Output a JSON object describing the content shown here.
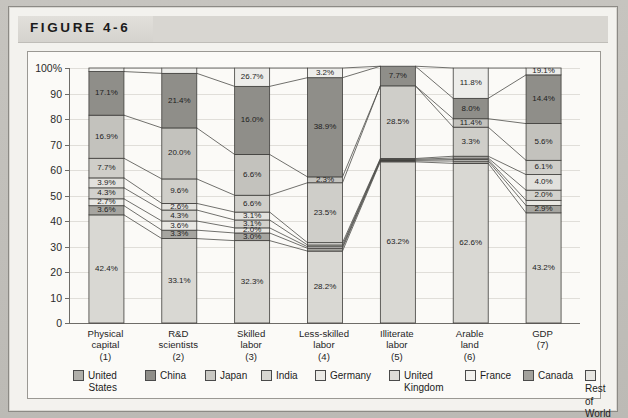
{
  "figure": {
    "title": "FIGURE 4-6"
  },
  "chart_data": {
    "type": "bar",
    "stacked": true,
    "stack_mode": "percent",
    "title": "FIGURE 4-6",
    "xlabel": "",
    "ylabel": "",
    "ylim": [
      0,
      100
    ],
    "yticks": [
      0,
      10,
      20,
      30,
      40,
      50,
      60,
      70,
      80,
      90,
      100
    ],
    "ytick_labels": [
      "0",
      "10",
      "20",
      "30",
      "40",
      "50",
      "60",
      "70",
      "80",
      "90",
      "100%"
    ],
    "grid": true,
    "legend_position": "bottom",
    "connector_lines": true,
    "categories": [
      "Physical capital",
      "R&D scientists",
      "Skilled labor",
      "Less-skilled labor",
      "Illiterate labor",
      "Arable land",
      "GDP"
    ],
    "category_numbers": [
      "(1)",
      "(2)",
      "(3)",
      "(4)",
      "(5)",
      "(6)",
      "(7)"
    ],
    "category_lines": [
      [
        "Physical",
        "capital",
        "(1)"
      ],
      [
        "R&D",
        "scientists",
        "(2)"
      ],
      [
        "Skilled",
        "labor",
        "(3)"
      ],
      [
        "Less-skilled",
        "labor",
        "(4)"
      ],
      [
        "Illiterate",
        "labor",
        "(5)"
      ],
      [
        "Arable",
        "land",
        "(6)"
      ],
      [
        "GDP",
        "(7)"
      ]
    ],
    "series": [
      {
        "name": "United States",
        "color": "#d9d8d3",
        "values": [
          42.4,
          33.1,
          32.3,
          28.2,
          63.2,
          62.6,
          43.2
        ]
      },
      {
        "name": "Canada",
        "color": "#a6a5a0",
        "values": [
          3.6,
          3.3,
          3.0,
          1.1,
          0.4,
          0.9,
          2.9
        ]
      },
      {
        "name": "France",
        "color": "#e8e7e3",
        "values": [
          2.7,
          3.6,
          2.0,
          0.6,
          0.3,
          0.6,
          2.0
        ]
      },
      {
        "name": "United Kingdom",
        "color": "#d2d1cc",
        "values": [
          4.3,
          4.3,
          3.1,
          0.7,
          0.3,
          0.6,
          4.0
        ]
      },
      {
        "name": "Germany",
        "color": "#e2e1dd",
        "values": [
          3.9,
          2.6,
          3.1,
          0.9,
          0.3,
          0.7,
          6.1
        ]
      },
      {
        "name": "India",
        "color": "#cfcec9",
        "values": [
          7.7,
          9.6,
          6.6,
          23.5,
          28.5,
          11.4,
          5.6
        ]
      },
      {
        "name": "Japan",
        "color": "#c3c2bd",
        "values": [
          16.9,
          20.0,
          16.0,
          2.3,
          0.0,
          3.3,
          14.4
        ]
      },
      {
        "name": "China",
        "color": "#8f8e89",
        "values": [
          17.1,
          21.4,
          26.7,
          38.9,
          7.7,
          8.0,
          19.1
        ]
      },
      {
        "name": "Rest of World",
        "color": "#ededea",
        "values": [
          1.4,
          2.1,
          7.2,
          3.8,
          0.0,
          11.9,
          2.7
        ]
      }
    ],
    "labeled_segments": [
      {
        "category": 0,
        "labels": [
          "42.4%",
          "3.6%",
          "2.7%",
          "4.3%",
          "3.9%",
          "7.7%",
          "16.9%",
          "17.1%"
        ]
      },
      {
        "category": 1,
        "labels": [
          "33.1%",
          "3.3%",
          "3.6%",
          "4.3%",
          "2.6%",
          "9.6%",
          "20.0%",
          "21.4%"
        ]
      },
      {
        "category": 2,
        "labels": [
          "32.3%",
          "3.0%",
          "2.0%",
          "3.1%",
          "3.1%",
          "6.6%",
          "6.6%",
          "16.0%",
          "26.7%"
        ]
      },
      {
        "category": 3,
        "labels": [
          "28.2%",
          "23.5%",
          "2.3%",
          "38.9%",
          "3.2%"
        ]
      },
      {
        "category": 4,
        "labels": [
          "63.2%",
          "28.5%",
          "7.7%"
        ]
      },
      {
        "category": 5,
        "labels": [
          "62.6%",
          "3.3%",
          "11.4%",
          "8.0%",
          "11.8%"
        ]
      },
      {
        "category": 6,
        "labels": [
          "43.2%",
          "2.9%",
          "2.0%",
          "4.0%",
          "6.1%",
          "5.6%",
          "14.4%",
          "19.1%"
        ]
      }
    ],
    "legend": [
      {
        "label": "United States",
        "line1": "United",
        "line2": "States",
        "color": "#b0afaa"
      },
      {
        "label": "China",
        "line1": "China",
        "line2": "",
        "color": "#8f8e89"
      },
      {
        "label": "Japan",
        "line1": "Japan",
        "line2": "",
        "color": "#c9c8c3"
      },
      {
        "label": "India",
        "line1": "India",
        "line2": "",
        "color": "#d7d6d1"
      },
      {
        "label": "Germany",
        "line1": "Germany",
        "line2": "",
        "color": "#ebeae6"
      },
      {
        "label": "United Kingdom",
        "line1": "United",
        "line2": "Kingdom",
        "color": "#dedcd8"
      },
      {
        "label": "France",
        "line1": "France",
        "line2": "",
        "color": "#f2f1ee"
      },
      {
        "label": "Canada",
        "line1": "Canada",
        "line2": "",
        "color": "#a3a29d"
      },
      {
        "label": "Rest of World",
        "line1": "Rest of",
        "line2": "World",
        "color": "#e6e5e1"
      }
    ]
  }
}
